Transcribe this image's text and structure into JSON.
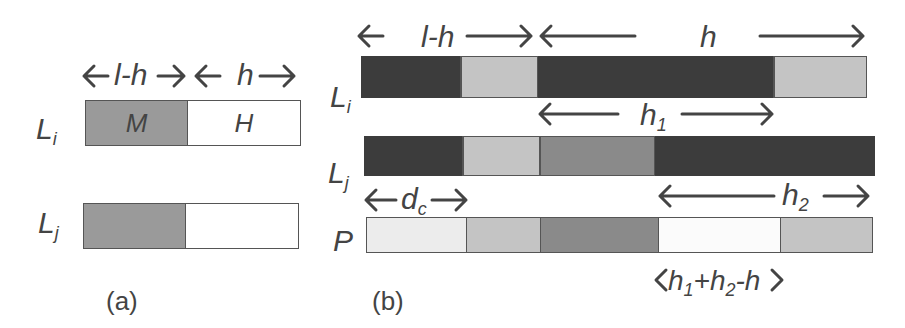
{
  "colors": {
    "dark": "#3c3c3c",
    "medium": "#8a8a8a",
    "light": "#c4c4c4",
    "verylight": "#ececec",
    "white": "#ffffff",
    "m_gray": "#9a9a9a"
  },
  "panel_a": {
    "caption": "(a)",
    "row_labels": {
      "li": "L",
      "li_sub": "i",
      "lj": "L",
      "lj_sub": "j"
    },
    "arrow_labels": {
      "l_minus_h": "l-h",
      "h": "h"
    },
    "segments": {
      "m": "M",
      "h": "H"
    }
  },
  "panel_b": {
    "caption": "(b)",
    "row_labels": {
      "li": "L",
      "li_sub": "i",
      "lj": "L",
      "lj_sub": "j",
      "p": "P"
    },
    "arrow_labels": {
      "l_minus_h": "l-h",
      "h": "h",
      "h1": "h",
      "h1_sub": "1",
      "h2": "h",
      "h2_sub": "2",
      "dc": "d",
      "dc_sub": "c",
      "overlap": "h1+h2-h"
    }
  }
}
